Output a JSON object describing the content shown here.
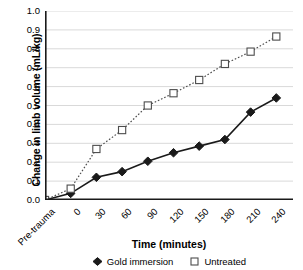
{
  "chart_data": {
    "type": "line",
    "title": "",
    "xlabel": "Time (minutes)",
    "ylabel": "Change in limb volume (mL/kg)",
    "categories": [
      "Pre-trauma",
      "0",
      "30",
      "60",
      "90",
      "120",
      "150",
      "180",
      "210",
      "240"
    ],
    "ylim": [
      0.0,
      1.0
    ],
    "ytick_labels": [
      "1.0",
      "0.9",
      "0.8",
      "0.7",
      "0.6",
      "0.5",
      "0.4",
      "0.3",
      "0.2",
      "0.1",
      "0.0"
    ],
    "ytick_values": [
      1.0,
      0.9,
      0.8,
      0.7,
      0.6,
      0.5,
      0.4,
      0.3,
      0.2,
      0.1,
      0.0
    ],
    "grid": true,
    "grid_axis": "y",
    "legend_position": "bottom",
    "series": [
      {
        "name": "Gold immersion",
        "marker": "filled-diamond",
        "line_style": "solid",
        "color": "#1a1a1a",
        "values": [
          0.0,
          0.035,
          0.12,
          0.15,
          0.205,
          0.25,
          0.285,
          0.32,
          0.465,
          0.54
        ]
      },
      {
        "name": "Untreated",
        "marker": "open-square",
        "line_style": "dotted",
        "color": "#4d4d4d",
        "values": [
          0.0,
          0.06,
          0.27,
          0.37,
          0.5,
          0.565,
          0.635,
          0.72,
          0.785,
          0.865
        ]
      }
    ]
  },
  "colors": {
    "background": "#ffffff",
    "axis": "#1a1a1a",
    "gridline": "#d9d9d9",
    "series_solid": "#1a1a1a",
    "series_dotted": "#4d4d4d",
    "text": "#000000"
  }
}
